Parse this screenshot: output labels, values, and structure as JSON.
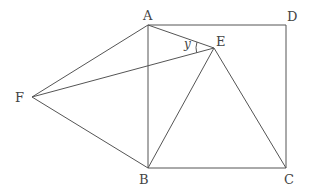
{
  "diagram": {
    "points": {
      "A": {
        "label": "A",
        "x": 148,
        "y": 25,
        "lx": 143,
        "ly": 20
      },
      "D": {
        "label": "D",
        "x": 286,
        "y": 25,
        "lx": 287,
        "ly": 21
      },
      "B": {
        "label": "B",
        "x": 148,
        "y": 168,
        "lx": 139,
        "ly": 184
      },
      "C": {
        "label": "C",
        "x": 286,
        "y": 168,
        "lx": 284,
        "ly": 184
      },
      "E": {
        "label": "E",
        "x": 214,
        "y": 48,
        "lx": 216,
        "ly": 46
      },
      "F": {
        "label": "F",
        "x": 32,
        "y": 97,
        "lx": 15,
        "ly": 102
      }
    },
    "segments": [
      [
        "A",
        "D"
      ],
      [
        "D",
        "C"
      ],
      [
        "C",
        "B"
      ],
      [
        "B",
        "A"
      ],
      [
        "A",
        "E"
      ],
      [
        "E",
        "B"
      ],
      [
        "E",
        "C"
      ],
      [
        "F",
        "A"
      ],
      [
        "F",
        "B"
      ],
      [
        "F",
        "E"
      ]
    ],
    "angle_label": {
      "text": "y",
      "x": 184,
      "y": 48,
      "vertex": "E"
    },
    "stroke_color": "#555555"
  }
}
